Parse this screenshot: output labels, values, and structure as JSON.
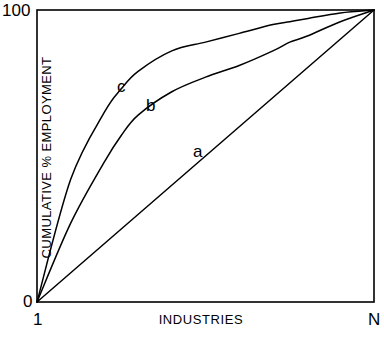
{
  "chart_data": {
    "type": "line",
    "title": "",
    "subtitle": "",
    "xlabel": "INDUSTRIES",
    "ylabel": "CUMULATIVE % EMPLOYMENT",
    "xlim": [
      0,
      100
    ],
    "ylim": [
      0,
      100
    ],
    "grid": false,
    "legend_position": "inline-annotations",
    "x_tick_labels": [
      "1",
      "N"
    ],
    "y_tick_labels": [
      "0",
      "100"
    ],
    "x_tick_values": [
      0,
      100
    ],
    "y_tick_values": [
      0,
      100
    ],
    "annotations": [
      {
        "text": "a",
        "x": 48,
        "y": 52
      },
      {
        "text": "b",
        "x": 33,
        "y": 68
      },
      {
        "text": "c",
        "x": 25,
        "y": 76
      }
    ],
    "series": [
      {
        "name": "a",
        "label": "a",
        "description": "diagonal line of equality",
        "x": [
          0,
          10,
          20,
          30,
          40,
          50,
          60,
          70,
          80,
          90,
          100
        ],
        "values": [
          0,
          10,
          20,
          30,
          40,
          50,
          60,
          70,
          80,
          90,
          100
        ]
      },
      {
        "name": "b",
        "label": "b",
        "description": "moderately concave cumulative curve",
        "x": [
          0,
          10,
          20,
          25,
          30,
          40,
          50,
          60,
          70,
          75,
          80,
          90,
          100
        ],
        "values": [
          0,
          27,
          48,
          57,
          64,
          72,
          77,
          81,
          86,
          89,
          91,
          96,
          100
        ]
      },
      {
        "name": "c",
        "label": "c",
        "description": "strongly concave cumulative curve",
        "x": [
          0,
          10,
          20,
          25,
          30,
          40,
          50,
          60,
          70,
          75,
          80,
          90,
          100
        ],
        "values": [
          0,
          42,
          65,
          73,
          79,
          86,
          89,
          92,
          95,
          96,
          97,
          99,
          100
        ]
      }
    ]
  },
  "axes": {
    "y_max_label": "100",
    "y_min_label": "0",
    "x_first_label": "1",
    "x_last_label": "N",
    "x_title": "INDUSTRIES",
    "y_title": "CUMULATIVE % EMPLOYMENT"
  },
  "labels": {
    "curve_a": "a",
    "curve_b": "b",
    "curve_c": "c"
  },
  "colors": {
    "background": "#ffffff",
    "ink": "#000000",
    "axis": "#000000",
    "curve": "#000000"
  }
}
